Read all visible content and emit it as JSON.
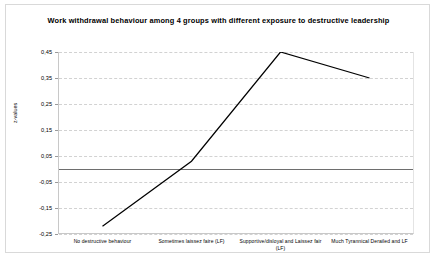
{
  "chart_data": {
    "type": "line",
    "title": "Work withdrawal behaviour among 4 groups with different exposure to destructive leadership",
    "xlabel": "",
    "ylabel": "z-values",
    "categories": [
      "No destructive behaviour",
      "Sometimes laissez faire (LF)",
      "Supportive/disloyal and Laissez fair (LF)",
      "Much Tyrannical Derailed and LF"
    ],
    "values": [
      -0.22,
      0.03,
      0.45,
      0.35
    ],
    "ylim": [
      -0.25,
      0.45
    ],
    "yticks": [
      0.45,
      0.35,
      0.25,
      0.15,
      0.05,
      -0.05,
      -0.15,
      -0.25
    ],
    "ytick_labels": [
      "0,45",
      "0,35",
      "0,25",
      "0,15",
      "0,05",
      "-0,05",
      "-0,15",
      "-0,25"
    ],
    "grid": true,
    "legend": "none",
    "zero_reference_line": 0,
    "series_color": "#000000",
    "grid_color": "#d2d2d2"
  }
}
